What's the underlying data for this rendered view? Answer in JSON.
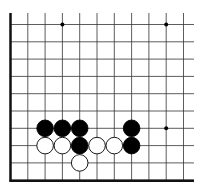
{
  "board": {
    "grid": {
      "x0": 10.5,
      "y0": 24.5,
      "step": 17.3,
      "cols": 11,
      "rows": 10,
      "top_extend": 13,
      "right_extend": 194,
      "line_color": "#333333",
      "edge_left": true,
      "edge_bottom": true
    },
    "star_points": [
      [
        3,
        0
      ],
      [
        9,
        0
      ],
      [
        9,
        6
      ]
    ],
    "stones": [
      {
        "color": "black",
        "col": 2,
        "row": 6
      },
      {
        "color": "black",
        "col": 3,
        "row": 6
      },
      {
        "color": "black",
        "col": 4,
        "row": 6
      },
      {
        "color": "black",
        "col": 7,
        "row": 6
      },
      {
        "color": "white",
        "col": 2,
        "row": 7
      },
      {
        "color": "white",
        "col": 3,
        "row": 7
      },
      {
        "color": "black",
        "col": 4,
        "row": 7
      },
      {
        "color": "white",
        "col": 5,
        "row": 7
      },
      {
        "color": "white",
        "col": 6,
        "row": 7
      },
      {
        "color": "black",
        "col": 7,
        "row": 7
      },
      {
        "color": "white",
        "col": 4,
        "row": 8
      }
    ],
    "colors": {
      "black": "#000000",
      "white": "#ffffff",
      "stone_outline": "#000000"
    }
  }
}
